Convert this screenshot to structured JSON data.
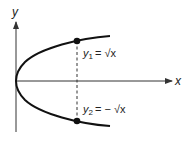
{
  "axes": {
    "x_label": "x",
    "y_label": "y"
  },
  "curve": {
    "description": "parabola opening right, x = y^2"
  },
  "labels": {
    "upper": {
      "var": "y",
      "sub": "1",
      "rhs": "= √x"
    },
    "lower": {
      "var": "y",
      "sub": "2",
      "rhs": "= − √x"
    }
  },
  "colors": {
    "ink": "#1a1a1a"
  }
}
